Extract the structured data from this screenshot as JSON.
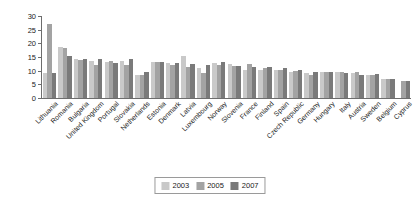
{
  "chart_data": {
    "type": "bar",
    "title": "",
    "xlabel": "",
    "ylabel": "Birth rate",
    "ylim": [
      0,
      30
    ],
    "yticks": [
      0,
      5,
      10,
      15,
      20,
      25,
      30
    ],
    "grid": false,
    "legend_position": "bottom-center",
    "legend_entries": [
      "2003",
      "2005",
      "2007"
    ],
    "categories": [
      "Lithuania",
      "Romania",
      "Bulgaria",
      "United Kingdom",
      "Portugal",
      "Slovakia",
      "Netherlands",
      "Estonia",
      "Denmark",
      "Latvia",
      "Luxembourg",
      "Norway",
      "Slovenia",
      "France",
      "Finland",
      "Spain",
      "Czech Republic",
      "Germany",
      "Hungary",
      "Italy",
      "Austria",
      "Sweden",
      "Belgium",
      "Cyprus"
    ],
    "series": [
      {
        "name": "2003",
        "color": "#c9c9c9",
        "values": [
          9.2,
          18.6,
          14.2,
          13.4,
          13.2,
          13.4,
          8.6,
          13.1,
          12.9,
          15.4,
          10.9,
          12.9,
          12.3,
          10.2,
          10.3,
          10.3,
          9.7,
          9.0,
          9.5,
          9.6,
          9.2,
          8.5,
          7.0,
          0.0
        ]
      },
      {
        "name": "2005",
        "color": "#a3a3a3",
        "values": [
          27.0,
          18.3,
          13.8,
          12.0,
          13.6,
          12.2,
          8.4,
          13.0,
          12.0,
          11.5,
          9.2,
          12.1,
          11.6,
          12.3,
          11.0,
          10.1,
          10.0,
          8.3,
          9.7,
          9.4,
          9.4,
          8.3,
          6.9,
          6.2
        ]
      },
      {
        "name": "2007",
        "color": "#7a7a7a",
        "values": [
          9.2,
          15.4,
          14.1,
          14.2,
          12.8,
          14.3,
          9.7,
          13.0,
          12.8,
          12.5,
          12.1,
          13.0,
          11.6,
          11.3,
          11.5,
          11.0,
          10.3,
          9.6,
          9.7,
          9.3,
          8.6,
          8.8,
          7.0,
          6.4
        ]
      }
    ]
  }
}
